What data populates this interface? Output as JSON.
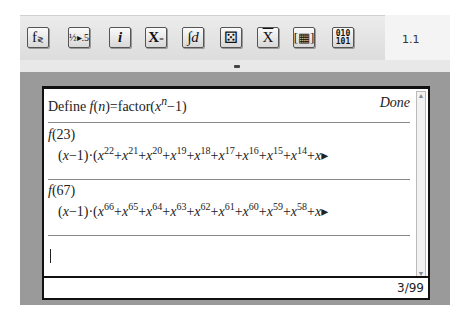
{
  "toolbar": {
    "buttons": [
      {
        "name": "function-catalog-button",
        "icon": "function-compare-icon",
        "glyph": "f≷"
      },
      {
        "name": "fraction-decimal-button",
        "icon": "fraction-to-decimal-icon",
        "glyph": "½▸.5"
      },
      {
        "name": "info-button",
        "icon": "info-icon",
        "glyph": "i"
      },
      {
        "name": "variables-button",
        "icon": "variable-assign-icon",
        "glyph": "X="
      },
      {
        "name": "calculus-button",
        "icon": "integral-icon",
        "glyph": "∫d"
      },
      {
        "name": "probability-button",
        "icon": "dice-icon",
        "glyph": "⚄"
      },
      {
        "name": "statistics-button",
        "icon": "mean-x-bar-icon",
        "glyph": "X̄"
      },
      {
        "name": "matrix-button",
        "icon": "matrix-icon",
        "glyph": "▦"
      },
      {
        "name": "base-conversion-button",
        "icon": "binary-icon",
        "glyph": "010\n101"
      }
    ],
    "page_number": "1.1"
  },
  "history": {
    "entries": [
      {
        "input": "Define f(n)=factor(x^n−1)",
        "output": "Done"
      },
      {
        "input": "f(23)",
        "output_prefix": "(x−1)·(",
        "exponents": [
          "22",
          "21",
          "20",
          "19",
          "18",
          "17",
          "16",
          "15",
          "14"
        ],
        "truncated": true
      },
      {
        "input": "f(67)",
        "output_prefix": "(x−1)·(",
        "exponents": [
          "66",
          "65",
          "64",
          "63",
          "62",
          "61",
          "60",
          "59",
          "58"
        ],
        "truncated": true
      }
    ]
  },
  "entry_line": {
    "value": ""
  },
  "status": {
    "position": "3/99"
  }
}
